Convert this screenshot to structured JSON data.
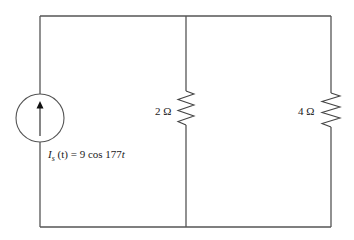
{
  "diagram": {
    "type": "circuit",
    "source": {
      "kind": "current-source",
      "direction": "up",
      "label_symbol": "I",
      "label_subscript": "s",
      "label_arg": " (t) = 9 cos 177",
      "label_var": "t",
      "amplitude": 9,
      "angular_frequency": 177
    },
    "resistors": [
      {
        "id": "R1",
        "value": "2 Ω",
        "ohms": 2
      },
      {
        "id": "R2",
        "value": "4 Ω",
        "ohms": 4
      }
    ],
    "colors": {
      "wire": "#555555",
      "text": "#222222",
      "background": "#ffffff"
    }
  }
}
